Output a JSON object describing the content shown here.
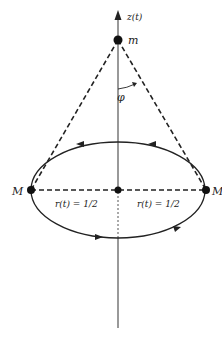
{
  "labels": {
    "axis": "z(t)",
    "top_mass": "m",
    "angle": "φ",
    "left_mass": "M",
    "right_mass": "M",
    "left_radius": "r(t) = 1/2",
    "right_radius": "r(t) = 1/2"
  },
  "geometry": {
    "axis_x": 118,
    "top_mass_y": 40,
    "ring_center_y": 190,
    "ring_left_x": 31,
    "ring_right_x": 206,
    "ring_ry": 48
  },
  "colors": {
    "ink": "#222222",
    "axis": "#555555"
  }
}
